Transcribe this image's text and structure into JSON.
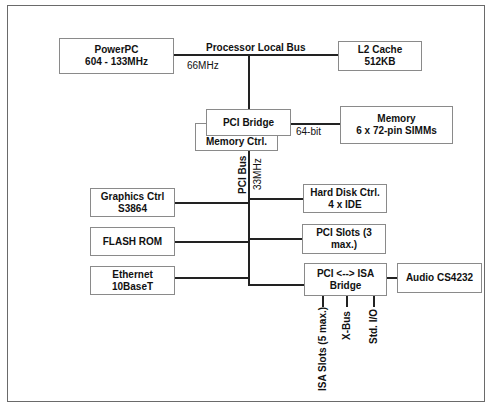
{
  "diagram": {
    "nodes": {
      "powerpc": [
        "PowerPC",
        "604 - 133MHz"
      ],
      "l2cache": [
        "L2 Cache",
        "512KB"
      ],
      "pci_bridge": [
        "PCI Bridge"
      ],
      "memory_ctrl": [
        "Memory Ctrl."
      ],
      "memory": [
        "Memory",
        "6 x 72-pin SIMMs"
      ],
      "graphics": [
        "Graphics Ctrl",
        "S3864"
      ],
      "flash": [
        "FLASH ROM"
      ],
      "ethernet": [
        "Ethernet",
        "10BaseT"
      ],
      "hdd": [
        "Hard Disk Ctrl.",
        "4 x IDE"
      ],
      "pci_slots": [
        "PCI Slots (3 max.)"
      ],
      "isa_bridge": [
        "PCI <--> ISA",
        "Bridge"
      ],
      "audio": [
        "Audio CS4232"
      ]
    },
    "labels": {
      "plb": "Processor Local Bus",
      "plb_speed": "66MHz",
      "mem_width": "64-bit",
      "pci_bus": "PCI Bus",
      "pci_speed": "33MHz",
      "isa_slots": "ISA Slots (5 max.)",
      "xbus": "X-Bus",
      "stdio": "Std. I/O"
    }
  }
}
